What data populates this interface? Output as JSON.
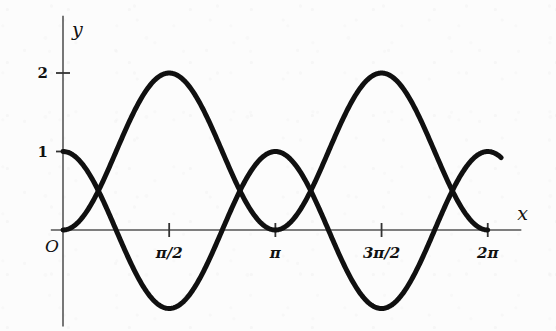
{
  "figure": {
    "background_color": "#fcfcfc",
    "ink_color": "#111111",
    "axis_color": "#555555",
    "curve_color": "#101010"
  },
  "axes": {
    "x_axis_label": "x",
    "y_axis_label": "y",
    "origin_label": "O"
  },
  "chart_data": {
    "type": "line",
    "title": "",
    "subtitle": "",
    "xlabel": "x",
    "ylabel": "y",
    "grid": false,
    "legend": "none",
    "xlim": [
      -0.18,
      6.78
    ],
    "ylim": [
      -1.45,
      2.45
    ],
    "x_ticks": [
      {
        "value": 1.5707963,
        "label": "π/2"
      },
      {
        "value": 3.1415927,
        "label": "π"
      },
      {
        "value": 4.712389,
        "label": "3π/2"
      },
      {
        "value": 6.2831853,
        "label": "2π"
      }
    ],
    "y_ticks": [
      {
        "value": 1,
        "label": "1"
      },
      {
        "value": 2,
        "label": "2"
      }
    ],
    "series": [
      {
        "name": "1 - cos(2x)",
        "formula": "y = 1 - cos(2x)",
        "color": "#101010",
        "line_width": 5,
        "x_start": 0,
        "x_end": 6.2831853,
        "samples": 420,
        "key_points": [
          {
            "x": 0,
            "y": 0
          },
          {
            "x": 1.5707963,
            "y": 2
          },
          {
            "x": 3.1415927,
            "y": 0
          },
          {
            "x": 4.712389,
            "y": 2
          },
          {
            "x": 6.2831853,
            "y": 0
          }
        ]
      },
      {
        "name": "cos(2x)",
        "formula": "y = cos(2x)",
        "color": "#101010",
        "line_width": 5,
        "x_start": 0,
        "x_end": 6.480398,
        "samples": 420,
        "key_points": [
          {
            "x": 0,
            "y": 1
          },
          {
            "x": 0.7853982,
            "y": 0
          },
          {
            "x": 1.5707963,
            "y": -1
          },
          {
            "x": 2.3561945,
            "y": 0
          },
          {
            "x": 3.1415927,
            "y": 1
          },
          {
            "x": 3.9269908,
            "y": 0
          },
          {
            "x": 4.712389,
            "y": -1
          },
          {
            "x": 5.4977871,
            "y": 0
          },
          {
            "x": 6.2831853,
            "y": 1
          }
        ]
      }
    ],
    "annotations": []
  },
  "geometry": {
    "origin_px": {
      "x": 63,
      "y": 230
    },
    "x_unit_px": 67.6,
    "y_unit_px": 78.5
  }
}
